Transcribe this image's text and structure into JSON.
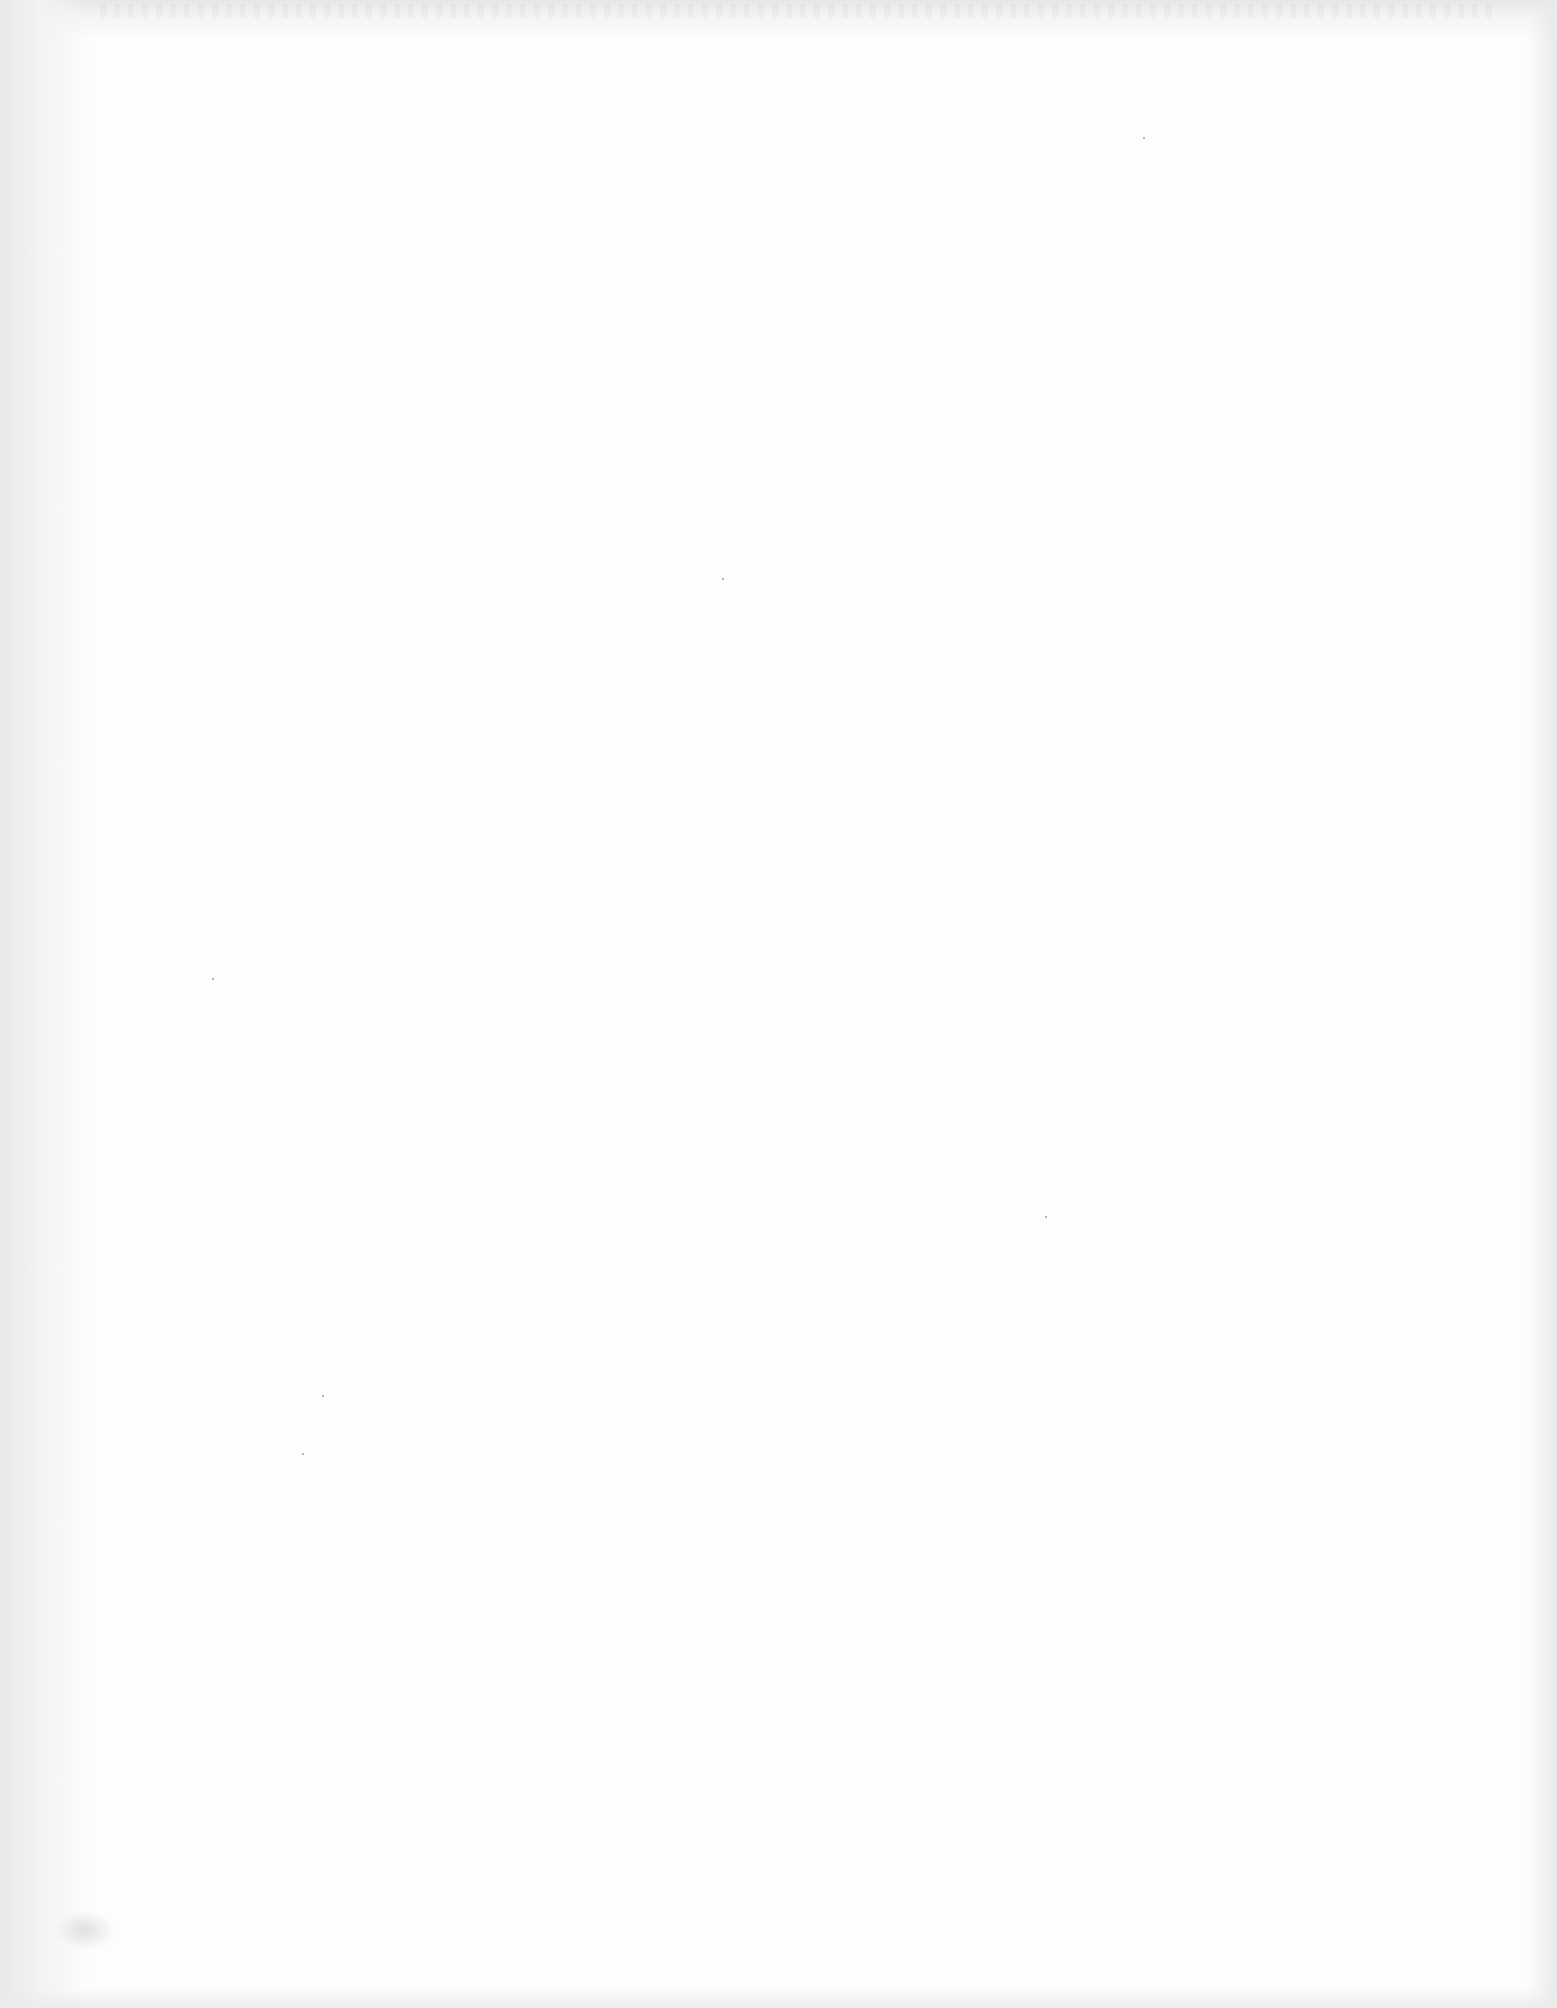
{
  "document": {
    "type": "blank scanned page",
    "visible_text": []
  }
}
